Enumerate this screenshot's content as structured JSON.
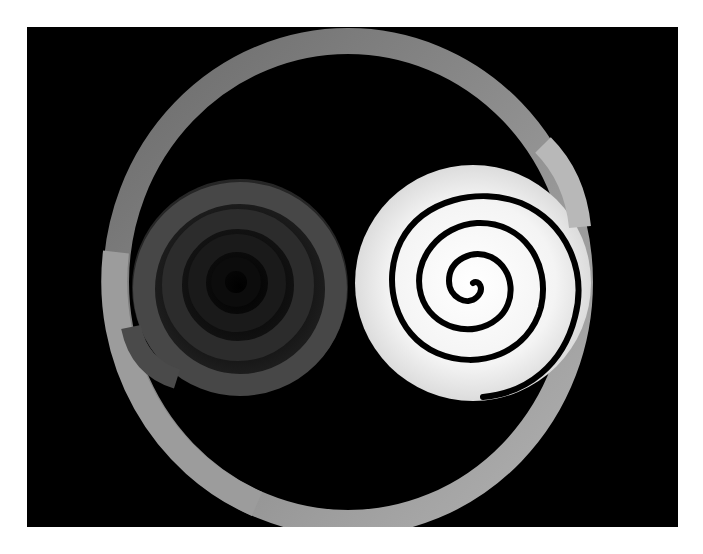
{
  "figure": {
    "background_color": "#000000",
    "page_color": "#ffffff",
    "outer_ring": {
      "center": [
        321,
        255
      ],
      "rx": 232,
      "ry": 241,
      "thickness": 26,
      "colors": {
        "top_left": "#6e6e6e",
        "top_right": "#8c8c8c",
        "right": "#b4b4b4",
        "bottom": "#a8a8a8",
        "lower_left": "#9c9c9c"
      }
    },
    "left_spiral": {
      "center": [
        213,
        260
      ],
      "outer_radius": 108,
      "ring_colors": [
        "#4a4a4a",
        "#2e2e2e",
        "#1c1c1c",
        "#0e0e0e"
      ]
    },
    "right_spiral": {
      "center": [
        446,
        256
      ],
      "outer_radius": 118,
      "disc_color": "#f2f2f2",
      "center_color": "#ffffff",
      "line_color": "#000000",
      "turns": 4
    }
  }
}
